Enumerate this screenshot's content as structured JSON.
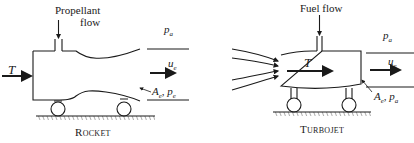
{
  "rocket": {
    "inlet_label_line1": "Propellant",
    "inlet_label_line2": "flow",
    "thrust_label": "T",
    "ambient_pressure_label": "p",
    "ambient_pressure_sub": "a",
    "exit_velocity_label": "u",
    "exit_velocity_sub": "e",
    "exit_area_label": "A",
    "exit_area_sub": "e",
    "exit_pressure_label": "p",
    "exit_pressure_sub": "e",
    "caption": "Rocket"
  },
  "turbojet": {
    "inlet_label": "Fuel flow",
    "thrust_label": "T",
    "ambient_pressure_label": "p",
    "ambient_pressure_sub": "a",
    "exit_velocity_label": "u",
    "exit_velocity_sub": "e",
    "exit_area_label": "A",
    "exit_area_sub": "e",
    "exit_pressure_label": "p",
    "exit_pressure_sub": "a",
    "caption": "Turbojet"
  },
  "colors": {
    "ink": "#1a1a1a",
    "background": "#ffffff"
  }
}
